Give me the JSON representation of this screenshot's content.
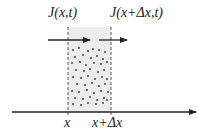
{
  "diagram": {
    "labels": {
      "flux_in": "J(x,t)",
      "flux_out": "J(x+Δx,t)",
      "x_left": "x",
      "x_right": "x+Δx"
    },
    "colors": {
      "shade": "#ebebeb",
      "ink": "#222222",
      "dot": "#333333"
    }
  }
}
